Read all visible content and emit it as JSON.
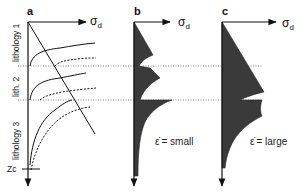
{
  "figure": {
    "panels": [
      {
        "id": "a",
        "label": "a",
        "x_axis_label": "σ",
        "x_axis_subscript": "d",
        "layers": [
          "lithology 1",
          "lith. 2",
          "lithology 3"
        ],
        "depth_marker": "Zc",
        "curves": {
          "solid": "strength curve (brittle/ductile) per lithology",
          "dashed": "strength curve at alternate strain rate",
          "diagonal": "frictional strength line"
        }
      },
      {
        "id": "b",
        "label": "b",
        "x_axis_label": "σ",
        "x_axis_subscript": "d",
        "strain_rate_symbol": "ε̇",
        "condition_text": "= small"
      },
      {
        "id": "c",
        "label": "c",
        "x_axis_label": "σ",
        "x_axis_subscript": "d",
        "strain_rate_symbol": "ε̇",
        "condition_text": "= large"
      }
    ],
    "boundaries": {
      "lith1_lith2_y": 66,
      "lith2_lith3_y": 100
    },
    "colors": {
      "fill": "#3a3a3a",
      "line": "#1a1a1a",
      "dotted": "#666666"
    }
  }
}
